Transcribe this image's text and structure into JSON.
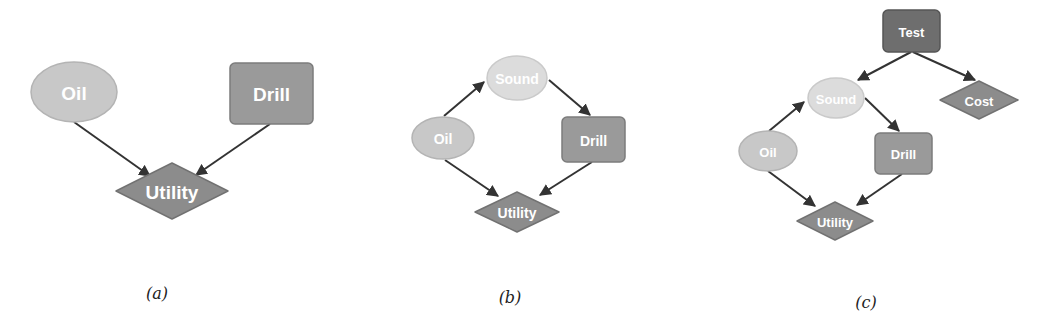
{
  "colors": {
    "chance": "#c8c8c8",
    "chance_stroke": "#b4b4b4",
    "sound": "#dcdcdc",
    "sound_stroke": "#cacaca",
    "decision": "#9a9a9a",
    "decision_stroke": "#7c7c7c",
    "test": "#6e6e6e",
    "test_stroke": "#555555",
    "utility": "#8c8c8c",
    "utility_stroke": "#727272",
    "edge": "#333333"
  },
  "panels": [
    {
      "id": "a",
      "caption": "(a)",
      "caption_pos": [
        157,
        293
      ],
      "nodes": [
        {
          "id": "oil",
          "label": "Oil",
          "shape": "ellipse",
          "type": "chance",
          "cx": 74,
          "cy": 92,
          "rx": 43,
          "ry": 30,
          "font": 19
        },
        {
          "id": "drill",
          "label": "Drill",
          "shape": "rect",
          "type": "decision",
          "x": 230,
          "y": 63,
          "w": 83,
          "h": 61,
          "font": 19
        },
        {
          "id": "utility",
          "label": "Utility",
          "shape": "diamond",
          "type": "utility",
          "cx": 172,
          "cy": 191,
          "hw": 56,
          "hh": 28,
          "font": 19
        }
      ],
      "edges": [
        {
          "from": "oil",
          "to": "utility",
          "x1": 74,
          "y1": 122,
          "x2": 150,
          "y2": 176
        },
        {
          "from": "drill",
          "to": "utility",
          "x1": 270,
          "y1": 124,
          "x2": 196,
          "y2": 175
        }
      ]
    },
    {
      "id": "b",
      "caption": "(b)",
      "caption_pos": [
        510,
        297
      ],
      "nodes": [
        {
          "id": "sound",
          "label": "Sound",
          "shape": "ellipse",
          "type": "sound",
          "cx": 517,
          "cy": 78,
          "rx": 30,
          "ry": 22,
          "font": 14
        },
        {
          "id": "oil",
          "label": "Oil",
          "shape": "ellipse",
          "type": "chance",
          "cx": 443,
          "cy": 138,
          "rx": 31,
          "ry": 21,
          "font": 14
        },
        {
          "id": "drill",
          "label": "Drill",
          "shape": "rect",
          "type": "decision",
          "x": 562,
          "y": 117,
          "w": 63,
          "h": 45,
          "font": 14
        },
        {
          "id": "utility",
          "label": "Utility",
          "shape": "diamond",
          "type": "utility",
          "cx": 517,
          "cy": 212,
          "hw": 42,
          "hh": 20,
          "font": 14
        }
      ],
      "edges": [
        {
          "from": "oil",
          "to": "sound",
          "x1": 444,
          "y1": 116,
          "x2": 484,
          "y2": 82
        },
        {
          "from": "sound",
          "to": "drill",
          "x1": 549,
          "y1": 80,
          "x2": 590,
          "y2": 115
        },
        {
          "from": "oil",
          "to": "utility",
          "x1": 445,
          "y1": 160,
          "x2": 498,
          "y2": 196
        },
        {
          "from": "drill",
          "to": "utility",
          "x1": 592,
          "y1": 162,
          "x2": 540,
          "y2": 195
        }
      ]
    },
    {
      "id": "c",
      "caption": "(c)",
      "caption_pos": [
        866,
        302
      ],
      "nodes": [
        {
          "id": "test",
          "label": "Test",
          "shape": "rect",
          "type": "test",
          "x": 883,
          "y": 10,
          "w": 57,
          "h": 42,
          "font": 13
        },
        {
          "id": "cost",
          "label": "Cost",
          "shape": "diamond",
          "type": "utility",
          "cx": 979,
          "cy": 100,
          "hw": 39,
          "hh": 19,
          "font": 13
        },
        {
          "id": "sound",
          "label": "Sound",
          "shape": "ellipse",
          "type": "sound",
          "cx": 836,
          "cy": 98,
          "rx": 28,
          "ry": 20,
          "font": 13
        },
        {
          "id": "oil",
          "label": "Oil",
          "shape": "ellipse",
          "type": "chance",
          "cx": 768,
          "cy": 151,
          "rx": 29,
          "ry": 20,
          "font": 13
        },
        {
          "id": "drill",
          "label": "Drill",
          "shape": "rect",
          "type": "decision",
          "x": 875,
          "y": 133,
          "w": 57,
          "h": 41,
          "font": 13
        },
        {
          "id": "utility",
          "label": "Utility",
          "shape": "diamond",
          "type": "utility",
          "cx": 835,
          "cy": 221,
          "hw": 38,
          "hh": 19,
          "font": 13
        }
      ],
      "edges": [
        {
          "from": "test",
          "to": "sound",
          "x1": 911,
          "y1": 52,
          "x2": 858,
          "y2": 80
        },
        {
          "from": "test",
          "to": "cost",
          "x1": 913,
          "y1": 52,
          "x2": 975,
          "y2": 80
        },
        {
          "from": "oil",
          "to": "sound",
          "x1": 769,
          "y1": 131,
          "x2": 804,
          "y2": 102
        },
        {
          "from": "sound",
          "to": "drill",
          "x1": 865,
          "y1": 98,
          "x2": 899,
          "y2": 131
        },
        {
          "from": "oil",
          "to": "utility",
          "x1": 768,
          "y1": 171,
          "x2": 815,
          "y2": 206
        },
        {
          "from": "drill",
          "to": "utility",
          "x1": 902,
          "y1": 174,
          "x2": 857,
          "y2": 205
        }
      ]
    }
  ]
}
